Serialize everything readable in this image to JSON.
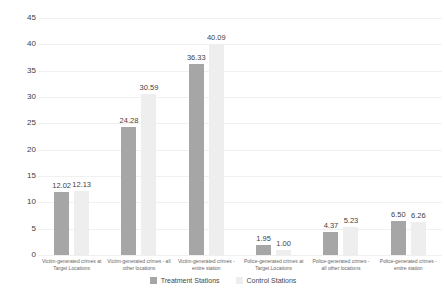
{
  "chart_data": {
    "type": "bar",
    "title": "",
    "xlabel": "",
    "ylabel": "",
    "categories": [
      "Victim-generated crimes at Target Locations",
      "Victim-generated crimes - all other locations",
      "Victim-generated crimes - entire station",
      "Police-generated crimes at Target Locations",
      "Police-generated crimes - all other locations",
      "Police-generated crimes - entire station"
    ],
    "series": [
      {
        "name": "Treatment Stations",
        "color": "#a6a6a6",
        "values": [
          12.02,
          24.28,
          36.33,
          1.95,
          4.37,
          6.5
        ]
      },
      {
        "name": "Control Stations",
        "color": "#eeeeee",
        "values": [
          12.13,
          30.59,
          40.09,
          1.0,
          5.23,
          6.26
        ]
      }
    ],
    "value_label_decimals": 2,
    "ylim": [
      0,
      45
    ],
    "yticks": [
      45,
      40,
      35,
      30,
      25,
      20,
      15,
      10,
      5,
      0
    ],
    "grid": true,
    "legend_position": "bottom",
    "colors": {
      "gridline": "#f0f0f0",
      "tick_text": "#404040",
      "value_text": "#3f3f3f",
      "category_text": "#666666",
      "legend_text": "#474747",
      "background": "#ffffff"
    }
  }
}
